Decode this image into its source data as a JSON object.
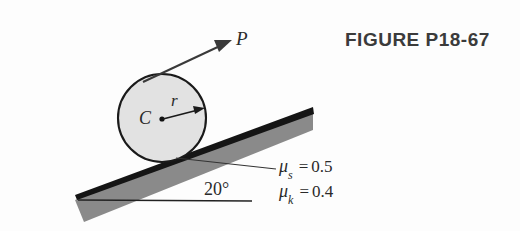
{
  "figure": {
    "title": "FIGURE P18-67",
    "background_color": "#fdfdfd"
  },
  "diagram": {
    "type": "free-body-incline-diagram",
    "incline": {
      "angle_label": "20°",
      "angle_degrees": 20,
      "wedge_fill": "#8a8a8a",
      "wedge_edge_color": "#151515",
      "baseline_label": "horizontal-reference-line"
    },
    "cylinder": {
      "center_label": "C",
      "radius_label": "r",
      "fill_color": "#e2e2e2",
      "stroke_color": "#1a1a1a"
    },
    "applied_force": {
      "label": "P",
      "arrow_color": "#3a3a3a"
    },
    "friction": {
      "static": {
        "symbol": "μ",
        "subscript": "s",
        "equals": "=",
        "value": "0.5"
      },
      "kinetic": {
        "symbol": "μ",
        "subscript": "k",
        "equals": "=",
        "value": "0.4"
      }
    }
  }
}
